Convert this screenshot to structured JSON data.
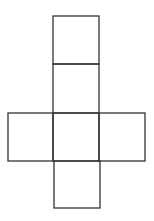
{
  "diagram": {
    "type": "cube-net",
    "stroke_color": "#333333",
    "background": "#ffffff",
    "squares": [
      {
        "id": "top",
        "x": 53,
        "y": 16,
        "w": 46,
        "h": 48
      },
      {
        "id": "upper-middle",
        "x": 53,
        "y": 64,
        "w": 46,
        "h": 49
      },
      {
        "id": "left",
        "x": 8,
        "y": 113,
        "w": 45,
        "h": 48
      },
      {
        "id": "center",
        "x": 53,
        "y": 113,
        "w": 46,
        "h": 48
      },
      {
        "id": "right",
        "x": 99,
        "y": 113,
        "w": 46,
        "h": 48
      },
      {
        "id": "bottom",
        "x": 54,
        "y": 161,
        "w": 46,
        "h": 47
      }
    ]
  }
}
